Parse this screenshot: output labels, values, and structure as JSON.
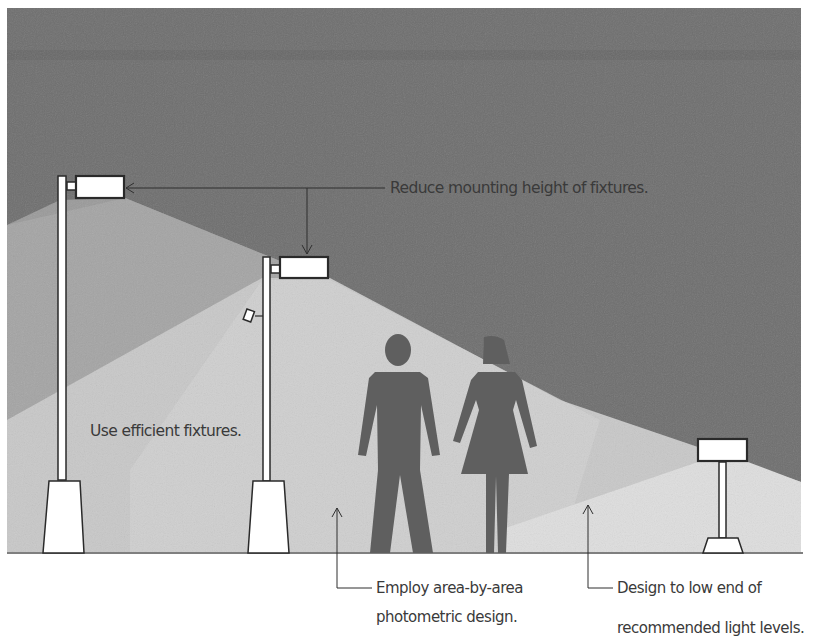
{
  "diagram": {
    "colors": {
      "sky": "#6e6e6e",
      "sky_band": "#646464",
      "mid_light": "#9a9a9a",
      "light_cone": "#c8c8c8",
      "light_cone_bright": "#dedede",
      "figure": "#5f5f5f",
      "fixture_fill": "#ffffff",
      "outline": "#2a2a2a",
      "ground": "#555555",
      "text": "#3a3a3a"
    },
    "callouts": {
      "reduce_height": "Reduce mounting height of fixtures.",
      "efficient": "Use efficient fixtures.",
      "photometric_line1": "Employ area-by-area",
      "photometric_line2": "photometric design.",
      "low_end_line1": "Design to low end of",
      "low_end_line2": "recommended light levels."
    },
    "elements": {
      "tall_pole": "Tall pole luminaire",
      "medium_pole": "Medium pole luminaire",
      "bollard": "Low bollard luminaire",
      "man": "Man figure",
      "woman": "Woman figure"
    }
  }
}
